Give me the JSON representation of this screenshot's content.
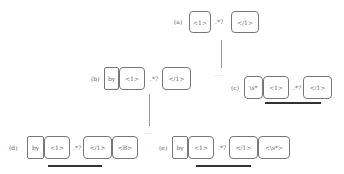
{
  "nodes": {
    "a": {
      "label": "(a)",
      "tokens": [
        "<1>",
        ".*?",
        "</1>"
      ]
    },
    "b": {
      "label": "(b)",
      "tokens": [
        "by",
        "<1>",
        ".*?",
        "</1>"
      ]
    },
    "c": {
      "label": "(c)",
      "tokens": [
        "\\s*",
        "<1>",
        ".*?",
        "</1>"
      ]
    },
    "d": {
      "label": "(d)",
      "tokens": [
        "by",
        "<1>",
        ".*?",
        "</1>",
        "<B>"
      ]
    },
    "e": {
      "label": "(e)",
      "tokens": [
        "by",
        "<1>",
        ".*?",
        "</1>",
        "<\\s*>"
      ]
    }
  },
  "ellipsis": "..."
}
